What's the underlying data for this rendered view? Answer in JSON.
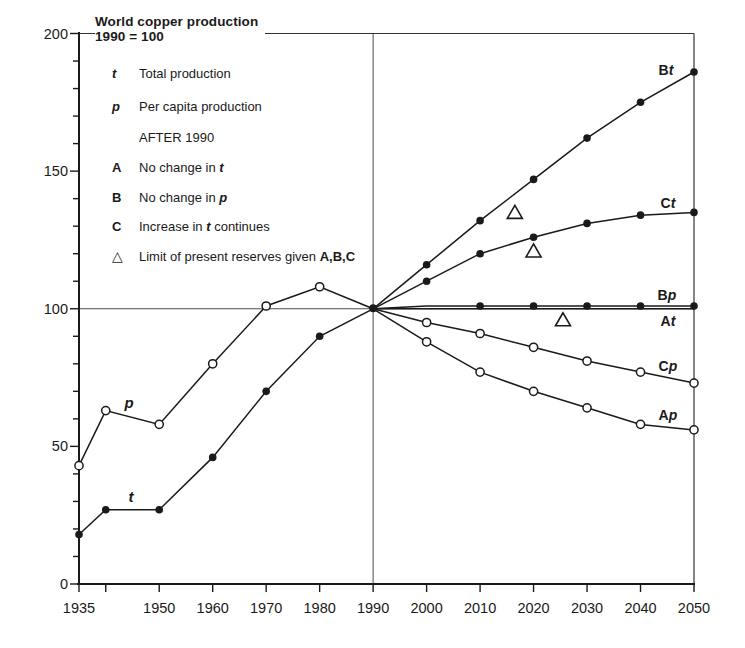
{
  "colors": {
    "ink": "#1a1a1a",
    "grid": "#4d4d4d",
    "background": "#ffffff"
  },
  "legend": {
    "title_line1": "World copper production",
    "title_line2": "1990 = 100",
    "items": [
      {
        "symbol": "t",
        "symbol_style": "bold-italic",
        "segments": [
          {
            "text": "Total production"
          }
        ]
      },
      {
        "symbol": "p",
        "symbol_style": "bold-italic",
        "segments": [
          {
            "text": "Per capita production"
          }
        ]
      },
      {
        "symbol": "",
        "symbol_style": "none",
        "segments": [
          {
            "text": "AFTER 1990"
          }
        ]
      },
      {
        "symbol": "A",
        "symbol_style": "bold",
        "segments": [
          {
            "text": "No change in "
          },
          {
            "text": "t",
            "style": "bold-italic"
          }
        ]
      },
      {
        "symbol": "B",
        "symbol_style": "bold",
        "segments": [
          {
            "text": "No change in "
          },
          {
            "text": "p",
            "style": "bold-italic"
          }
        ]
      },
      {
        "symbol": "C",
        "symbol_style": "bold",
        "segments": [
          {
            "text": "Increase in "
          },
          {
            "text": "t",
            "style": "bold-italic"
          },
          {
            "text": " continues"
          }
        ]
      },
      {
        "symbol": "△",
        "symbol_style": "triangle",
        "segments": [
          {
            "text": "Limit of present reserves given "
          },
          {
            "text": "A,B,C",
            "style": "bold"
          }
        ]
      }
    ]
  },
  "line_labels": [
    {
      "id": "Bt",
      "bold": "B",
      "italic": "t"
    },
    {
      "id": "Ct",
      "bold": "C",
      "italic": "t"
    },
    {
      "id": "Bp",
      "bold": "B",
      "italic": "p"
    },
    {
      "id": "At",
      "bold": "A",
      "italic": "t"
    },
    {
      "id": "Cp",
      "bold": "C",
      "italic": "p"
    },
    {
      "id": "Ap",
      "bold": "A",
      "italic": "p"
    }
  ],
  "curve_labels": [
    {
      "id": "p",
      "text": "p"
    },
    {
      "id": "t",
      "text": "t"
    }
  ],
  "chart_data": {
    "type": "line",
    "title": "World copper production",
    "subtitle": "1990 = 100",
    "xlabel": "",
    "ylabel": "",
    "xlim": [
      1935,
      2050
    ],
    "ylim": [
      0,
      200
    ],
    "x_ticks": [
      1935,
      1950,
      1960,
      1970,
      1980,
      1990,
      2000,
      2010,
      2020,
      2030,
      2040,
      2050
    ],
    "x_minor_ticks": [
      1940
    ],
    "y_ticks": [
      0,
      50,
      100,
      150,
      200
    ],
    "y_minor_step": 10,
    "grid": "reference lines only",
    "legend_position": "top-left text block",
    "reference_lines": {
      "vertical_at": 1990,
      "horizontal_at": 100
    },
    "series": [
      {
        "name": "t",
        "description": "Total production (historical)",
        "marker": "filled",
        "x": [
          1935,
          1940,
          1950,
          1960,
          1970,
          1980,
          1990
        ],
        "values": [
          18,
          27,
          27,
          46,
          70,
          90,
          100
        ],
        "marker_years": [
          1935,
          1940,
          1950,
          1960,
          1970,
          1980
        ]
      },
      {
        "name": "p",
        "description": "Per capita production (historical)",
        "marker": "open",
        "x": [
          1935,
          1940,
          1950,
          1960,
          1970,
          1980,
          1990
        ],
        "values": [
          43,
          63,
          58,
          80,
          101,
          108,
          100
        ],
        "marker_years": [
          1935,
          1940,
          1950,
          1960,
          1970,
          1980
        ]
      },
      {
        "name": "Bt",
        "description": "Total production if no change in p",
        "marker": "filled",
        "x": [
          1990,
          2000,
          2010,
          2020,
          2030,
          2040,
          2050
        ],
        "values": [
          100,
          116,
          132,
          147,
          162,
          175,
          186
        ],
        "marker_years": [
          2000,
          2010,
          2020,
          2030,
          2040,
          2050
        ]
      },
      {
        "name": "Ct",
        "description": "Total production if increase in t continues",
        "marker": "filled",
        "x": [
          1990,
          2000,
          2010,
          2020,
          2030,
          2040,
          2050
        ],
        "values": [
          100,
          110,
          120,
          126,
          131,
          134,
          135
        ],
        "marker_years": [
          2000,
          2010,
          2020,
          2030,
          2040,
          2050
        ]
      },
      {
        "name": "Bp",
        "description": "Per capita production if no change in p",
        "marker": "filled",
        "x": [
          1990,
          2000,
          2010,
          2020,
          2030,
          2040,
          2050
        ],
        "values": [
          100,
          101,
          101,
          101,
          101,
          101,
          101
        ],
        "marker_years": [
          2010,
          2020,
          2030,
          2040,
          2050
        ]
      },
      {
        "name": "At",
        "description": "Total production if no change in t",
        "marker": "none",
        "x": [
          1990,
          2050
        ],
        "values": [
          100,
          100
        ],
        "marker_years": []
      },
      {
        "name": "Cp",
        "description": "Per capita production if increase in t continues",
        "marker": "open",
        "x": [
          1990,
          2000,
          2010,
          2020,
          2030,
          2040,
          2050
        ],
        "values": [
          100,
          95,
          91,
          86,
          81,
          77,
          73
        ],
        "marker_years": [
          2000,
          2010,
          2020,
          2030,
          2040,
          2050
        ]
      },
      {
        "name": "Ap",
        "description": "Per capita production if no change in t",
        "marker": "open",
        "x": [
          1990,
          2000,
          2010,
          2020,
          2030,
          2040,
          2050
        ],
        "values": [
          100,
          88,
          77,
          70,
          64,
          58,
          56
        ],
        "marker_years": [
          2000,
          2010,
          2020,
          2030,
          2040,
          2050
        ]
      }
    ],
    "reserve_limit_markers": [
      {
        "near_series": "Bt",
        "year": 2016.5,
        "value": 135
      },
      {
        "near_series": "Ct",
        "year": 2020,
        "value": 121
      },
      {
        "near_series": "At",
        "year": 2025.5,
        "value": 96
      }
    ]
  }
}
